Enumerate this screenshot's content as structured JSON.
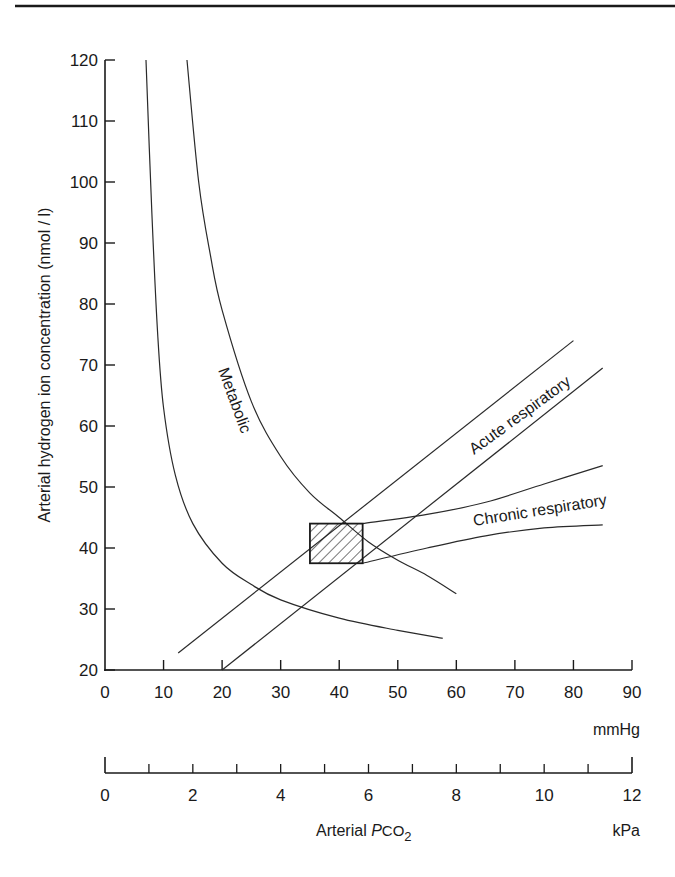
{
  "chart_data": {
    "type": "line",
    "title": "",
    "xlabel": "Arterial PCO2",
    "xlabel_main": "Arterial ",
    "xlabel_italic": "P",
    "xlabel_sub_text": "CO",
    "xlabel_subscript": "2",
    "ylabel": "Arterial hydrogen ion concentration (nmol / l)",
    "x_unit_primary": "mmHg",
    "x_unit_secondary": "kPa",
    "xlim": [
      0,
      90
    ],
    "ylim": [
      20,
      120
    ],
    "x_ticks_mmHg": [
      0,
      10,
      20,
      30,
      40,
      50,
      60,
      70,
      80,
      90
    ],
    "x_ticks_kPa": [
      0,
      2,
      4,
      6,
      8,
      10,
      12
    ],
    "x_minor_ticks_kPa": [
      1,
      3,
      5,
      7,
      9,
      11
    ],
    "y_ticks": [
      20,
      30,
      40,
      50,
      60,
      70,
      80,
      90,
      100,
      110,
      120
    ],
    "grid": false,
    "legend": null,
    "series": [
      {
        "name": "Metabolic (lower bound)",
        "label": "",
        "x": [
          7,
          8,
          9,
          10,
          12,
          15,
          20,
          25,
          30,
          40,
          50,
          57.7
        ],
        "y": [
          120,
          95,
          75,
          63,
          52,
          44,
          37.5,
          34,
          31.5,
          28.5,
          26.5,
          25.2
        ]
      },
      {
        "name": "Metabolic (upper bound)",
        "label": "Metabolic",
        "x": [
          14,
          16,
          18,
          20,
          25,
          30,
          35,
          40,
          45,
          50,
          55,
          60
        ],
        "y": [
          120,
          100,
          88,
          79,
          64,
          55,
          49,
          45,
          41,
          38,
          35.5,
          32.5
        ]
      },
      {
        "name": "Acute respiratory (upper)",
        "label": "Acute respiratory",
        "x": [
          12.5,
          80
        ],
        "y": [
          22.8,
          74
        ]
      },
      {
        "name": "Acute respiratory (lower)",
        "label": "",
        "x": [
          20,
          85
        ],
        "y": [
          20,
          69.5
        ]
      },
      {
        "name": "Chronic respiratory (upper)",
        "label": "Chronic respiratory",
        "x": [
          44,
          55,
          65,
          75,
          85
        ],
        "y": [
          44,
          45.5,
          47.5,
          50.5,
          53.5
        ]
      },
      {
        "name": "Chronic respiratory (lower)",
        "label": "",
        "x": [
          44,
          55,
          65,
          75,
          85
        ],
        "y": [
          37.5,
          40,
          42,
          43.3,
          43.8
        ]
      }
    ],
    "annotations": [
      {
        "type": "hatched-rectangle",
        "label": "Normal range",
        "x_range": [
          35,
          44
        ],
        "y_range": [
          37.5,
          44
        ]
      },
      {
        "type": "text",
        "text": "Metabolic",
        "x": 22,
        "y": 60,
        "rotation": 70
      },
      {
        "type": "text",
        "text": "Acute respiratory",
        "x": 65,
        "y": 59,
        "rotation": -36
      },
      {
        "type": "text",
        "text": "Chronic respiratory",
        "x": 64,
        "y": 45,
        "rotation": -9
      }
    ]
  },
  "labels": {
    "metabolic": "Metabolic",
    "acute": "Acute respiratory",
    "chronic": "Chronic respiratory",
    "ylabel": "Arterial hydrogen ion concentration (nmol / l)",
    "unit_mmHg": "mmHg",
    "unit_kPa": "kPa",
    "xlabel_prefix": "Arterial ",
    "xlabel_P": "P",
    "xlabel_CO": "CO",
    "xlabel_2": "2"
  }
}
